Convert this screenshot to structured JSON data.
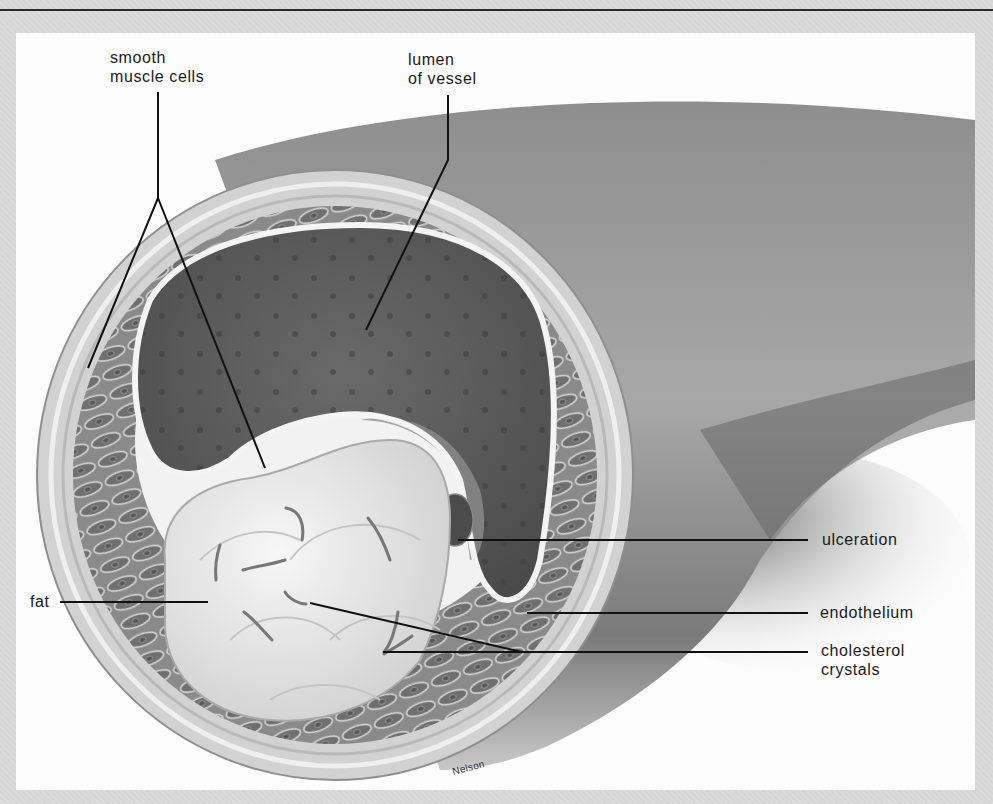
{
  "figure": {
    "colors": {
      "frame": "#d9d9d9",
      "panel": "#fdfdfd",
      "leader_line": "#111111",
      "vessel_outer": "#9a9a9a",
      "lumen": "#5e5e5e",
      "fat_plaque": "#ededed"
    },
    "labels": {
      "smooth_muscle_line1": "smooth",
      "smooth_muscle_line2": "muscle cells",
      "lumen_line1": "lumen",
      "lumen_line2": "of vessel",
      "ulceration": "ulceration",
      "endothelium": "endothelium",
      "cholesterol_line1": "cholesterol",
      "cholesterol_line2": "crystals",
      "fat": "fat"
    },
    "signature": "Nelson"
  }
}
